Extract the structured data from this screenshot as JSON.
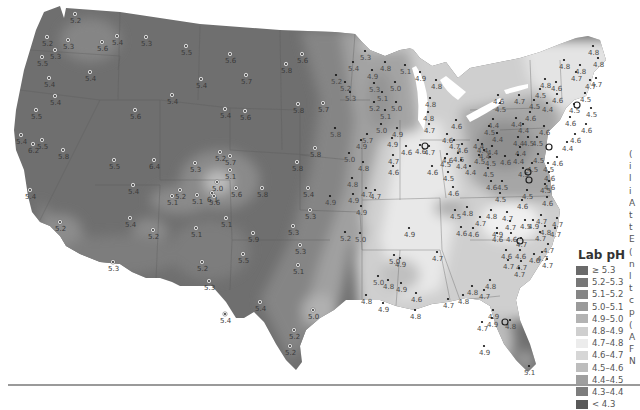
{
  "legend": {
    "title": "Lab pH",
    "items": [
      {
        "label": "≥ 5.3",
        "color": "#6a6a6a"
      },
      {
        "label": "5.2–5.3",
        "color": "#777777"
      },
      {
        "label": "5.1–5.2",
        "color": "#858585"
      },
      {
        "label": "5.0–5.1",
        "color": "#9a9a9a"
      },
      {
        "label": "4.9–5.0",
        "color": "#b3b3b3"
      },
      {
        "label": "4.8–4.9",
        "color": "#cfcfcf"
      },
      {
        "label": "4.7–4.8",
        "color": "#ececec"
      },
      {
        "label": "4.6–4.7",
        "color": "#d6d6d6"
      },
      {
        "label": "4.5–4.6",
        "color": "#bdbdbd"
      },
      {
        "label": "4.4–4.5",
        "color": "#9f9f9f"
      },
      {
        "label": "4.3–4.4",
        "color": "#7d7d7d"
      },
      {
        "label": "< 4.3",
        "color": "#595959"
      }
    ]
  },
  "side_text_chars": [
    "(",
    "i",
    "l",
    "i",
    "A",
    "t",
    "t",
    "E",
    "(",
    "n",
    "l",
    "t",
    "c",
    "p",
    "(",
    "A",
    "F",
    "N"
  ],
  "map": {
    "points": [
      {
        "x": 75,
        "y": 14,
        "v": "5.2"
      },
      {
        "x": 47,
        "y": 37,
        "v": "5.2"
      },
      {
        "x": 68,
        "y": 40,
        "v": "5.3"
      },
      {
        "x": 55,
        "y": 50,
        "v": "5.3"
      },
      {
        "x": 42,
        "y": 57,
        "v": "5.5"
      },
      {
        "x": 49,
        "y": 78,
        "v": "5.4"
      },
      {
        "x": 90,
        "y": 72,
        "v": "5.4"
      },
      {
        "x": 117,
        "y": 36,
        "v": "5.4"
      },
      {
        "x": 146,
        "y": 37,
        "v": "5.3"
      },
      {
        "x": 102,
        "y": 42,
        "v": "5.6"
      },
      {
        "x": 55,
        "y": 96,
        "v": "5.4"
      },
      {
        "x": 36,
        "y": 110,
        "v": "5.5"
      },
      {
        "x": 135,
        "y": 110,
        "v": "5.6"
      },
      {
        "x": 186,
        "y": 46,
        "v": "5.5"
      },
      {
        "x": 230,
        "y": 54,
        "v": "5.6"
      },
      {
        "x": 302,
        "y": 54,
        "v": "5.6"
      },
      {
        "x": 286,
        "y": 64,
        "v": "5.8"
      },
      {
        "x": 201,
        "y": 79,
        "v": "5.4"
      },
      {
        "x": 246,
        "y": 75,
        "v": "5.7"
      },
      {
        "x": 172,
        "y": 95,
        "v": "5.4"
      },
      {
        "x": 298,
        "y": 104,
        "v": "5.8"
      },
      {
        "x": 225,
        "y": 109,
        "v": "5.4"
      },
      {
        "x": 245,
        "y": 111,
        "v": "5.6"
      },
      {
        "x": 323,
        "y": 103,
        "v": "5.7"
      },
      {
        "x": 21,
        "y": 135,
        "v": "5.4"
      },
      {
        "x": 42,
        "y": 140,
        "v": "5.5"
      },
      {
        "x": 33,
        "y": 144,
        "v": "6.2"
      },
      {
        "x": 63,
        "y": 150,
        "v": "5.8"
      },
      {
        "x": 154,
        "y": 160,
        "v": "6.4"
      },
      {
        "x": 114,
        "y": 160,
        "v": "5.5"
      },
      {
        "x": 30,
        "y": 190,
        "v": "5.4"
      },
      {
        "x": 133,
        "y": 185,
        "v": "5.4"
      },
      {
        "x": 60,
        "y": 222,
        "v": "5.2"
      },
      {
        "x": 130,
        "y": 218,
        "v": "5.4"
      },
      {
        "x": 230,
        "y": 156,
        "v": "5.7"
      },
      {
        "x": 297,
        "y": 162,
        "v": "5.8"
      },
      {
        "x": 195,
        "y": 163,
        "v": "5.3"
      },
      {
        "x": 220,
        "y": 152,
        "v": "5.2"
      },
      {
        "x": 230,
        "y": 170,
        "v": "5.1"
      },
      {
        "x": 217,
        "y": 182,
        "v": "5.0"
      },
      {
        "x": 212,
        "y": 193,
        "v": "6.1"
      },
      {
        "x": 236,
        "y": 188,
        "v": "5.6"
      },
      {
        "x": 262,
        "y": 188,
        "v": "5.8"
      },
      {
        "x": 308,
        "y": 188,
        "v": "5.4"
      },
      {
        "x": 180,
        "y": 190,
        "v": "5.2"
      },
      {
        "x": 172,
        "y": 196,
        "v": "5.1"
      },
      {
        "x": 197,
        "y": 195,
        "v": "5.1"
      },
      {
        "x": 214,
        "y": 196,
        "v": "5.6"
      },
      {
        "x": 226,
        "y": 218,
        "v": "5.1"
      },
      {
        "x": 196,
        "y": 228,
        "v": "5.1"
      },
      {
        "x": 253,
        "y": 233,
        "v": "5.9"
      },
      {
        "x": 293,
        "y": 226,
        "v": "5.3"
      },
      {
        "x": 153,
        "y": 230,
        "v": "5.2"
      },
      {
        "x": 113,
        "y": 262,
        "v": "5.3"
      },
      {
        "x": 202,
        "y": 262,
        "v": "5.2"
      },
      {
        "x": 243,
        "y": 254,
        "v": "5.5"
      },
      {
        "x": 209,
        "y": 281,
        "v": "5.3"
      },
      {
        "x": 260,
        "y": 302,
        "v": "5.4"
      },
      {
        "x": 225,
        "y": 314,
        "v": "5.4"
      },
      {
        "x": 300,
        "y": 245,
        "v": "5.3"
      },
      {
        "x": 298,
        "y": 265,
        "v": "5.1"
      },
      {
        "x": 313,
        "y": 310,
        "v": "5.0"
      },
      {
        "x": 294,
        "y": 330,
        "v": "5.2"
      },
      {
        "x": 290,
        "y": 346,
        "v": "5.2"
      },
      {
        "x": 365,
        "y": 51,
        "v": "5.3"
      },
      {
        "x": 353,
        "y": 62,
        "v": "5.4"
      },
      {
        "x": 336,
        "y": 75,
        "v": "5.2"
      },
      {
        "x": 345,
        "y": 82,
        "v": "5.2"
      },
      {
        "x": 350,
        "y": 92,
        "v": "5.3"
      },
      {
        "x": 385,
        "y": 62,
        "v": "4.8"
      },
      {
        "x": 372,
        "y": 70,
        "v": "4.9"
      },
      {
        "x": 405,
        "y": 65,
        "v": "5.1"
      },
      {
        "x": 420,
        "y": 72,
        "v": "4.9"
      },
      {
        "x": 436,
        "y": 80,
        "v": "4.8"
      },
      {
        "x": 395,
        "y": 82,
        "v": "5.0"
      },
      {
        "x": 374,
        "y": 83,
        "v": "5.3"
      },
      {
        "x": 382,
        "y": 92,
        "v": "5.1"
      },
      {
        "x": 374,
        "y": 102,
        "v": "5.2"
      },
      {
        "x": 396,
        "y": 102,
        "v": "5.0"
      },
      {
        "x": 385,
        "y": 110,
        "v": "5.1"
      },
      {
        "x": 381,
        "y": 124,
        "v": "5.0"
      },
      {
        "x": 397,
        "y": 128,
        "v": "4.9"
      },
      {
        "x": 392,
        "y": 138,
        "v": "4.9"
      },
      {
        "x": 430,
        "y": 98,
        "v": "4.8"
      },
      {
        "x": 428,
        "y": 112,
        "v": "4.8"
      },
      {
        "x": 429,
        "y": 124,
        "v": "4.7"
      },
      {
        "x": 456,
        "y": 120,
        "v": "4.6"
      },
      {
        "x": 447,
        "y": 134,
        "v": "4.6"
      },
      {
        "x": 367,
        "y": 134,
        "v": "5.7"
      },
      {
        "x": 335,
        "y": 128,
        "v": "5.8"
      },
      {
        "x": 406,
        "y": 146,
        "v": "4.6"
      },
      {
        "x": 429,
        "y": 146,
        "v": "4.7"
      },
      {
        "x": 393,
        "y": 155,
        "v": "4.7"
      },
      {
        "x": 393,
        "y": 166,
        "v": "4.6"
      },
      {
        "x": 420,
        "y": 145,
        "v": "4.6"
      },
      {
        "x": 447,
        "y": 154,
        "v": "4.6"
      },
      {
        "x": 349,
        "y": 153,
        "v": "5.0"
      },
      {
        "x": 363,
        "y": 162,
        "v": "4.8"
      },
      {
        "x": 352,
        "y": 178,
        "v": "4.8"
      },
      {
        "x": 366,
        "y": 188,
        "v": "4.7"
      },
      {
        "x": 375,
        "y": 190,
        "v": "4.7"
      },
      {
        "x": 353,
        "y": 194,
        "v": "4.9"
      },
      {
        "x": 315,
        "y": 148,
        "v": "5.8"
      },
      {
        "x": 361,
        "y": 140,
        "v": "4.9"
      },
      {
        "x": 361,
        "y": 206,
        "v": "4.9"
      },
      {
        "x": 345,
        "y": 232,
        "v": "5.2"
      },
      {
        "x": 360,
        "y": 233,
        "v": "5.0"
      },
      {
        "x": 330,
        "y": 196,
        "v": "4.9"
      },
      {
        "x": 310,
        "y": 210,
        "v": "5.3"
      },
      {
        "x": 454,
        "y": 140,
        "v": "4.7"
      },
      {
        "x": 462,
        "y": 144,
        "v": "4.6"
      },
      {
        "x": 445,
        "y": 158,
        "v": "4.5"
      },
      {
        "x": 458,
        "y": 153,
        "v": "4.5"
      },
      {
        "x": 461,
        "y": 160,
        "v": "4.4"
      },
      {
        "x": 470,
        "y": 166,
        "v": "4.4"
      },
      {
        "x": 448,
        "y": 172,
        "v": "4.5"
      },
      {
        "x": 432,
        "y": 166,
        "v": "4.6"
      },
      {
        "x": 453,
        "y": 187,
        "v": "4.6"
      },
      {
        "x": 455,
        "y": 210,
        "v": "4.5"
      },
      {
        "x": 467,
        "y": 207,
        "v": "4.8"
      },
      {
        "x": 461,
        "y": 227,
        "v": "4.6"
      },
      {
        "x": 409,
        "y": 228,
        "v": "4.9"
      },
      {
        "x": 378,
        "y": 276,
        "v": "5.0"
      },
      {
        "x": 366,
        "y": 295,
        "v": "4.8"
      },
      {
        "x": 400,
        "y": 258,
        "v": "4.9"
      },
      {
        "x": 394,
        "y": 255,
        "v": "5.0"
      },
      {
        "x": 388,
        "y": 280,
        "v": "4.8"
      },
      {
        "x": 401,
        "y": 283,
        "v": "4.9"
      },
      {
        "x": 383,
        "y": 303,
        "v": "4.9"
      },
      {
        "x": 416,
        "y": 293,
        "v": "4.6"
      },
      {
        "x": 415,
        "y": 310,
        "v": "4.8"
      },
      {
        "x": 437,
        "y": 252,
        "v": "4.7"
      },
      {
        "x": 448,
        "y": 299,
        "v": "4.7"
      },
      {
        "x": 463,
        "y": 295,
        "v": "4.8"
      },
      {
        "x": 472,
        "y": 286,
        "v": "4.8"
      },
      {
        "x": 490,
        "y": 280,
        "v": "4.8"
      },
      {
        "x": 484,
        "y": 290,
        "v": "4.7"
      },
      {
        "x": 493,
        "y": 310,
        "v": "4.9"
      },
      {
        "x": 492,
        "y": 318,
        "v": "4.9"
      },
      {
        "x": 482,
        "y": 322,
        "v": "4.7"
      },
      {
        "x": 510,
        "y": 320,
        "v": "4.8"
      },
      {
        "x": 484,
        "y": 346,
        "v": "4.9"
      },
      {
        "x": 529,
        "y": 366,
        "v": "5.1"
      },
      {
        "x": 506,
        "y": 250,
        "v": "4.6"
      },
      {
        "x": 520,
        "y": 250,
        "v": "4.6"
      },
      {
        "x": 508,
        "y": 260,
        "v": "4.7"
      },
      {
        "x": 521,
        "y": 261,
        "v": "4.7"
      },
      {
        "x": 519,
        "y": 268,
        "v": "4.7"
      },
      {
        "x": 497,
        "y": 233,
        "v": "4.6"
      },
      {
        "x": 511,
        "y": 233,
        "v": "4.6"
      },
      {
        "x": 525,
        "y": 220,
        "v": "4.5"
      },
      {
        "x": 521,
        "y": 238,
        "v": "4.7"
      },
      {
        "x": 480,
        "y": 217,
        "v": "4.7"
      },
      {
        "x": 473,
        "y": 228,
        "v": "4.6"
      },
      {
        "x": 491,
        "y": 210,
        "v": "4.8"
      },
      {
        "x": 507,
        "y": 212,
        "v": "4.7"
      },
      {
        "x": 510,
        "y": 221,
        "v": "4.7"
      },
      {
        "x": 497,
        "y": 228,
        "v": "4.9"
      },
      {
        "x": 500,
        "y": 193,
        "v": "4.5"
      },
      {
        "x": 491,
        "y": 181,
        "v": "4.6"
      },
      {
        "x": 488,
        "y": 168,
        "v": "4.5"
      },
      {
        "x": 502,
        "y": 181,
        "v": "4.5"
      },
      {
        "x": 490,
        "y": 157,
        "v": "4.5"
      },
      {
        "x": 505,
        "y": 156,
        "v": "4.6"
      },
      {
        "x": 479,
        "y": 155,
        "v": "4.5"
      },
      {
        "x": 482,
        "y": 144,
        "v": "4.4"
      },
      {
        "x": 478,
        "y": 140,
        "v": "4.4"
      },
      {
        "x": 492,
        "y": 146,
        "v": "4.4"
      },
      {
        "x": 484,
        "y": 150,
        "v": "4.4"
      },
      {
        "x": 497,
        "y": 133,
        "v": "4.4"
      },
      {
        "x": 493,
        "y": 119,
        "v": "4.4"
      },
      {
        "x": 489,
        "y": 126,
        "v": "4.5"
      },
      {
        "x": 500,
        "y": 103,
        "v": "4.5"
      },
      {
        "x": 498,
        "y": 95,
        "v": "4.6"
      },
      {
        "x": 519,
        "y": 95,
        "v": "4.7"
      },
      {
        "x": 523,
        "y": 124,
        "v": "4.4"
      },
      {
        "x": 516,
        "y": 118,
        "v": "4.4"
      },
      {
        "x": 530,
        "y": 112,
        "v": "4.6"
      },
      {
        "x": 534,
        "y": 100,
        "v": "4.5"
      },
      {
        "x": 540,
        "y": 89,
        "v": "4.5"
      },
      {
        "x": 547,
        "y": 103,
        "v": "4.4"
      },
      {
        "x": 557,
        "y": 94,
        "v": "4.6"
      },
      {
        "x": 556,
        "y": 82,
        "v": "4.6"
      },
      {
        "x": 545,
        "y": 79,
        "v": "4.8"
      },
      {
        "x": 574,
        "y": 104,
        "v": "4.5"
      },
      {
        "x": 590,
        "y": 80,
        "v": "4.7"
      },
      {
        "x": 576,
        "y": 72,
        "v": "4.7"
      },
      {
        "x": 564,
        "y": 60,
        "v": "4.8"
      },
      {
        "x": 580,
        "y": 65,
        "v": "4.8"
      },
      {
        "x": 598,
        "y": 58,
        "v": "4.8"
      },
      {
        "x": 593,
        "y": 46,
        "v": "4.8"
      },
      {
        "x": 596,
        "y": 78,
        "v": "4.7"
      },
      {
        "x": 585,
        "y": 93,
        "v": "4.5"
      },
      {
        "x": 591,
        "y": 108,
        "v": "4.5"
      },
      {
        "x": 570,
        "y": 117,
        "v": "4.6"
      },
      {
        "x": 586,
        "y": 124,
        "v": "4.6"
      },
      {
        "x": 575,
        "y": 134,
        "v": "4.6"
      },
      {
        "x": 567,
        "y": 142,
        "v": "4.4"
      },
      {
        "x": 544,
        "y": 126,
        "v": "4.6"
      },
      {
        "x": 537,
        "y": 137,
        "v": "4.5"
      },
      {
        "x": 528,
        "y": 137,
        "v": "4.5"
      },
      {
        "x": 518,
        "y": 137,
        "v": "4.4"
      },
      {
        "x": 520,
        "y": 147,
        "v": "4.4"
      },
      {
        "x": 518,
        "y": 155,
        "v": "4.4"
      },
      {
        "x": 538,
        "y": 154,
        "v": "4.5"
      },
      {
        "x": 548,
        "y": 163,
        "v": "4.5"
      },
      {
        "x": 532,
        "y": 163,
        "v": "4.5"
      },
      {
        "x": 523,
        "y": 168,
        "v": "4.5"
      },
      {
        "x": 557,
        "y": 157,
        "v": "4.6"
      },
      {
        "x": 549,
        "y": 172,
        "v": "4.6"
      },
      {
        "x": 549,
        "y": 181,
        "v": "4.6"
      },
      {
        "x": 545,
        "y": 184,
        "v": "4.5"
      },
      {
        "x": 547,
        "y": 197,
        "v": "4.6"
      },
      {
        "x": 527,
        "y": 190,
        "v": "4.5"
      },
      {
        "x": 522,
        "y": 200,
        "v": "4.6"
      },
      {
        "x": 541,
        "y": 215,
        "v": "4.7"
      },
      {
        "x": 545,
        "y": 226,
        "v": "4.8"
      },
      {
        "x": 540,
        "y": 232,
        "v": "4.7"
      },
      {
        "x": 533,
        "y": 220,
        "v": "4.9"
      },
      {
        "x": 548,
        "y": 244,
        "v": "4.7"
      },
      {
        "x": 557,
        "y": 218,
        "v": "4.7"
      },
      {
        "x": 555,
        "y": 228,
        "v": "4.7"
      },
      {
        "x": 547,
        "y": 259,
        "v": "4.7"
      },
      {
        "x": 534,
        "y": 254,
        "v": "4.6"
      },
      {
        "x": 542,
        "y": 252,
        "v": "4.7"
      }
    ],
    "circled_points": [
      {
        "x": 425,
        "y": 146
      },
      {
        "x": 549,
        "y": 147
      },
      {
        "x": 528,
        "y": 172
      },
      {
        "x": 529,
        "y": 180
      },
      {
        "x": 577,
        "y": 105
      },
      {
        "x": 520,
        "y": 241
      },
      {
        "x": 505,
        "y": 322
      }
    ]
  }
}
